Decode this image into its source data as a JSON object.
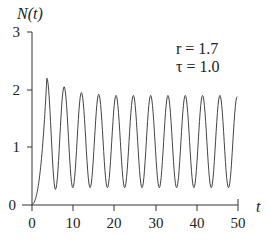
{
  "chart_data": {
    "type": "line",
    "title": "",
    "xlabel": "t",
    "ylabel": "N(t)",
    "xlim": [
      0,
      50
    ],
    "ylim": [
      0,
      3
    ],
    "grid": false,
    "legend": null,
    "x_ticks": [
      "0",
      "10",
      "20",
      "30",
      "40",
      "50"
    ],
    "y_ticks": [
      "0",
      "1",
      "2",
      "3"
    ],
    "annotations": [
      "r = 1.7",
      "τ = 1.0"
    ],
    "parameters": {
      "r": 1.7,
      "tau": 1.0
    },
    "series": [
      {
        "name": "N(t)",
        "description": "Delayed logistic oscillation: rises from ~0, first peak ~2.2 at t≈3.5, then sustained oscillations with period ≈4.2, peaks ≈1.9, troughs ≈0.3; ends at ~1.15 at t=50",
        "peaks_t": [
          3.6,
          7.8,
          12.0,
          16.2,
          20.4,
          24.6,
          28.8,
          33.0,
          37.2,
          41.4,
          45.6,
          49.8
        ],
        "peaks_N": [
          2.2,
          2.05,
          1.95,
          1.92,
          1.9,
          1.9,
          1.9,
          1.9,
          1.9,
          1.9,
          1.9,
          1.88
        ],
        "troughs_t": [
          5.7,
          9.9,
          14.1,
          18.3,
          22.5,
          26.7,
          30.9,
          35.1,
          39.3,
          43.5,
          47.7
        ],
        "troughs_N": [
          0.27,
          0.3,
          0.3,
          0.3,
          0.3,
          0.3,
          0.3,
          0.3,
          0.3,
          0.3,
          0.3
        ],
        "end": {
          "t": 50,
          "N": 1.15
        }
      }
    ]
  },
  "labels": {
    "ylabel": "N(t)",
    "xlabel": "t",
    "param_r": "r = 1.7",
    "param_tau": "τ = 1.0",
    "xt0": "0",
    "xt1": "10",
    "xt2": "20",
    "xt3": "30",
    "xt4": "40",
    "xt5": "50",
    "yt0": "0",
    "yt1": "1",
    "yt2": "2",
    "yt3": "3"
  }
}
